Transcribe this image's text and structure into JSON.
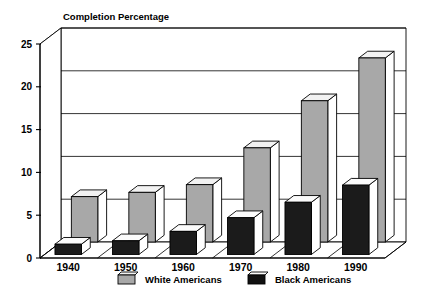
{
  "chart_data": {
    "type": "bar",
    "title": "Completion Percentage",
    "xlabel": "",
    "ylabel": "",
    "categories": [
      "1940",
      "1950",
      "1960",
      "1970",
      "1980",
      "1990"
    ],
    "series": [
      {
        "name": "White Americans",
        "color": "#a8a8a8",
        "values": [
          5.3,
          5.8,
          6.7,
          11.0,
          16.5,
          21.5
        ]
      },
      {
        "name": "Black Americans",
        "color": "#1b1b1b",
        "values": [
          1.2,
          1.6,
          2.7,
          4.3,
          6.1,
          8.1
        ]
      }
    ],
    "yticks": [
      "0",
      "5",
      "10",
      "15",
      "20",
      "25"
    ],
    "ytick_values": [
      0,
      5,
      10,
      15,
      20,
      25
    ],
    "ylim": [
      0,
      25
    ],
    "grid": true,
    "three_d": true,
    "legend_position": "bottom",
    "legend": [
      {
        "label": "White Americans",
        "color": "#a8a8a8"
      },
      {
        "label": "Black Americans",
        "color": "#1b1b1b"
      }
    ]
  }
}
